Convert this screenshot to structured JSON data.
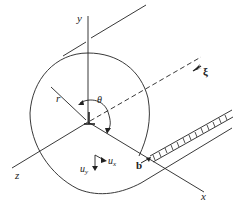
{
  "diagram": {
    "type": "screw dislocation cylinder geometry",
    "labels": {
      "y_axis": "y",
      "x_axis": "x",
      "z_axis": "z",
      "radius": "r",
      "angle": "θ",
      "line_direction": "ξ",
      "burgers": "b",
      "ux": "u",
      "ux_sub": "x",
      "uy": "u",
      "uy_sub": "y"
    },
    "colors": {
      "stroke": "#222222",
      "background": "#ffffff"
    }
  }
}
